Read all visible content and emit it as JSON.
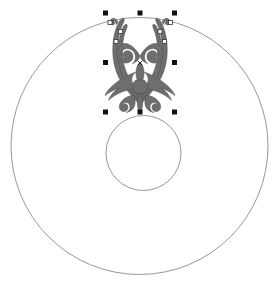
{
  "app": {
    "surface_name": "drawing-canvas",
    "background_color": "#ffffff",
    "width": 280,
    "height": 297
  },
  "shapes": {
    "outer_circle": {
      "name": "outer-circle",
      "cx": 139.5,
      "cy": 146,
      "r": 128.5,
      "stroke_color": "#8c8c8c",
      "stroke_width": 0.9,
      "fill": "none"
    },
    "inner_circle": {
      "name": "inner-circle",
      "cx": 143.5,
      "cy": 153,
      "r": 37.5,
      "stroke_color": "#8c8c8c",
      "stroke_width": 0.9,
      "fill": "none"
    },
    "ornament": {
      "name": "filigree-ornament",
      "fill_color": "#6e6e6e",
      "stroke_color": "#4f4f4f",
      "description": "symmetrical heraldic filigree flourish",
      "bbox": {
        "x": 105,
        "y": 14,
        "width": 72,
        "height": 98
      }
    }
  },
  "selection": {
    "name": "selection-handles",
    "handle_color": "#111111",
    "handle_size": 5,
    "node_marker_color": "#ffffff",
    "node_marker_stroke": "#333333",
    "node_marker_size": 4,
    "bbox": {
      "x": 105.5,
      "y": 13,
      "width": 69,
      "height": 99
    },
    "handles": [
      {
        "label": "top-left",
        "x": 105.5,
        "y": 13.0
      },
      {
        "label": "top-center",
        "x": 140.0,
        "y": 13.0
      },
      {
        "label": "top-right",
        "x": 174.5,
        "y": 13.0
      },
      {
        "label": "middle-left",
        "x": 105.5,
        "y": 62.5
      },
      {
        "label": "middle-right",
        "x": 174.5,
        "y": 62.5
      },
      {
        "label": "bottom-left",
        "x": 105.5,
        "y": 112.0
      },
      {
        "label": "bottom-center",
        "x": 140.0,
        "y": 112.0
      },
      {
        "label": "bottom-right",
        "x": 174.5,
        "y": 112.0
      }
    ],
    "node_markers": [
      {
        "label": "node-left-outer",
        "x": 110.0,
        "y": 22.5
      },
      {
        "label": "node-left-inner",
        "x": 120.5,
        "y": 31.5
      },
      {
        "label": "node-left-mid",
        "x": 116.0,
        "y": 41.5
      },
      {
        "label": "node-right-outer",
        "x": 170.5,
        "y": 22.5
      },
      {
        "label": "node-right-inner",
        "x": 160.0,
        "y": 31.5
      },
      {
        "label": "node-right-mid",
        "x": 164.5,
        "y": 41.5
      }
    ],
    "rotation_center": {
      "label": "rotation-center-marker",
      "x": 140.0,
      "y": 63.0,
      "size": 5,
      "color": "#222222"
    }
  }
}
